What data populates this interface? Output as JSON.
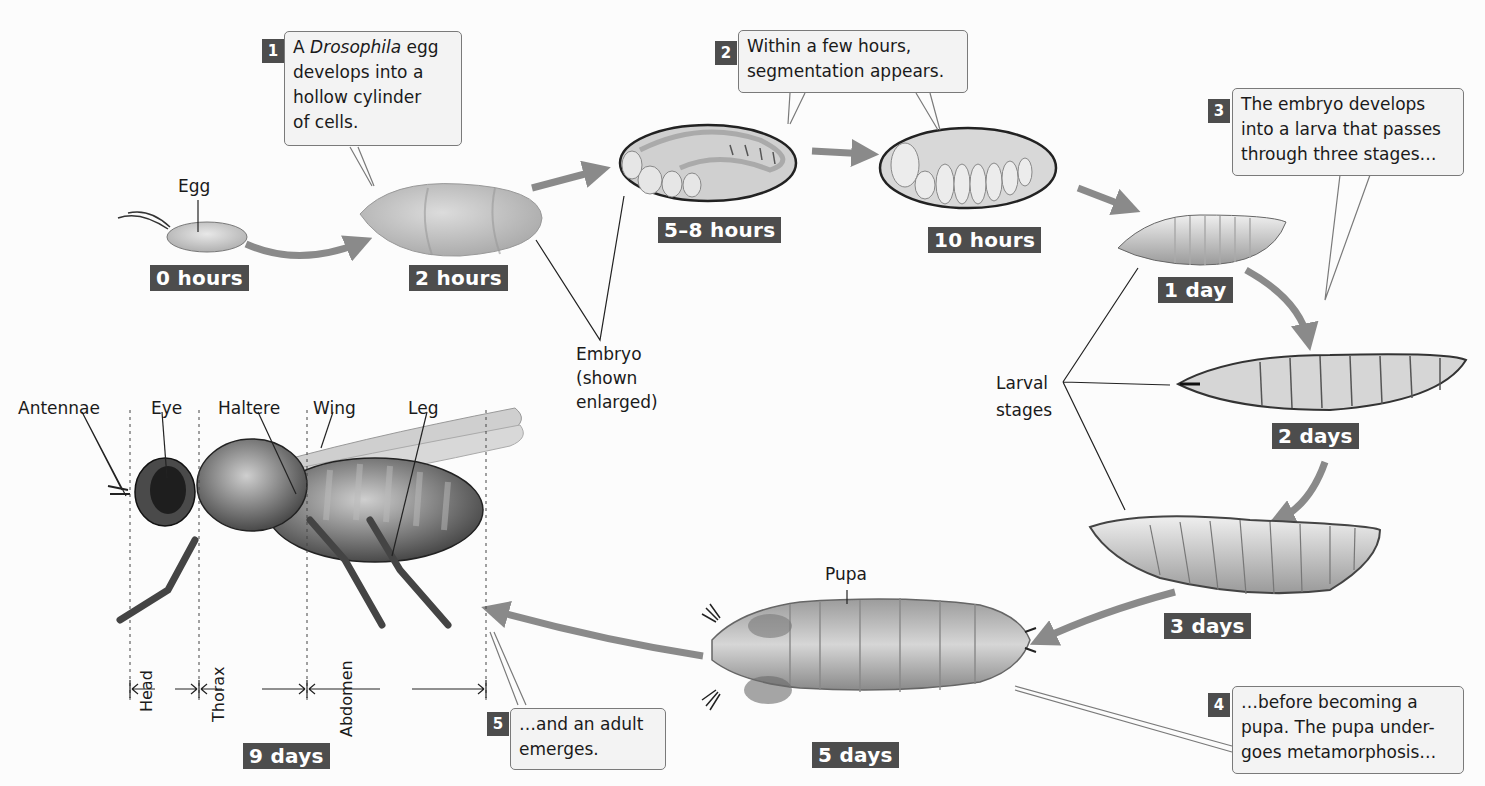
{
  "figure": {
    "accent_colors": {
      "badge": "#4d4d4d",
      "arrow": "#8a8a8a",
      "callout_bg": "#f3f3f3",
      "callout_border": "#7a7a7a"
    },
    "stages": [
      {
        "id": "egg",
        "label": "Egg",
        "time": "0 hours"
      },
      {
        "id": "cylinder",
        "time": "2 hours"
      },
      {
        "id": "segmented-embryo",
        "time": "5–8 hours"
      },
      {
        "id": "late-embryo",
        "time": "10 hours"
      },
      {
        "id": "larva-1",
        "time": "1 day"
      },
      {
        "id": "larva-2",
        "time": "2 days"
      },
      {
        "id": "larva-3",
        "time": "3 days"
      },
      {
        "id": "pupa",
        "label": "Pupa",
        "time": "5 days"
      },
      {
        "id": "adult",
        "time": "9 days"
      }
    ],
    "callouts": [
      {
        "num": "1",
        "prefix": "A ",
        "italic": "Drosophila",
        "suffix": " egg",
        "lines": [
          "develops into a",
          "hollow cylinder",
          "of cells."
        ]
      },
      {
        "num": "2",
        "lines": [
          "Within a few hours,",
          "segmentation appears."
        ]
      },
      {
        "num": "3",
        "lines": [
          "The embryo develops",
          "into a larva that passes",
          "through three stages…"
        ]
      },
      {
        "num": "4",
        "lines": [
          "…before becoming a",
          "pupa. The pupa under-",
          "goes metamorphosis…"
        ]
      },
      {
        "num": "5",
        "lines": [
          "…and an adult",
          "emerges."
        ]
      }
    ],
    "labels": {
      "embryo": [
        "Embryo",
        "(shown",
        "enlarged)"
      ],
      "larval_stages": [
        "Larval",
        "stages"
      ],
      "adult_parts": [
        "Antennae",
        "Eye",
        "Haltere",
        "Wing",
        "Leg"
      ],
      "body_regions": [
        "Head",
        "Thorax",
        "Abdomen"
      ]
    }
  }
}
